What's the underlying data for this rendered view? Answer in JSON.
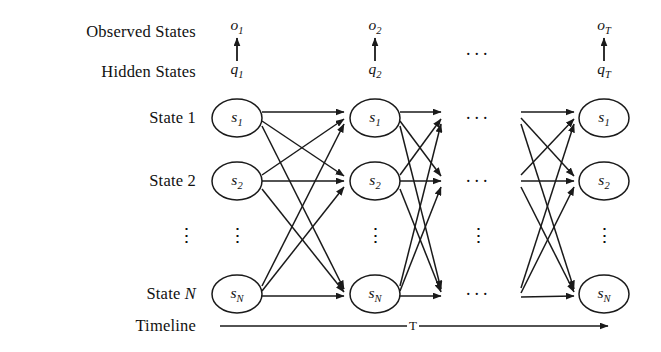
{
  "diagram": {
    "stroke_color": "#1a1a1a",
    "background_color": "#ffffff",
    "row_labels": [
      {
        "key": "observed",
        "text": "Observed States",
        "y": 32
      },
      {
        "key": "hidden",
        "text": "Hidden States",
        "y": 72
      },
      {
        "key": "state1",
        "text": "State 1",
        "y": 118
      },
      {
        "key": "state2",
        "text": "State 2",
        "y": 181
      },
      {
        "key": "stateN",
        "text": "State N",
        "y": 294
      },
      {
        "key": "timeline",
        "text": "Timeline",
        "y": 326
      }
    ],
    "row_vdots": {
      "text": "⋮",
      "y": 235
    },
    "observed_nodes": [
      {
        "label": "o",
        "sub": "1",
        "x": 237
      },
      {
        "label": "o",
        "sub": "2",
        "x": 375
      },
      {
        "label": "o",
        "sub": "T",
        "x": 604
      }
    ],
    "hidden_nodes": [
      {
        "label": "q",
        "sub": "1",
        "x": 237
      },
      {
        "label": "q",
        "sub": "2",
        "x": 375
      },
      {
        "label": "q",
        "sub": "T",
        "x": 604
      }
    ],
    "observed_y": 26,
    "hidden_y": 70,
    "columns": [
      {
        "key": "t1",
        "x": 237
      },
      {
        "key": "t2",
        "x": 375
      },
      {
        "key": "tT",
        "x": 604
      }
    ],
    "state_rows": [
      {
        "key": "s1",
        "label": "s",
        "sub": "1",
        "y": 118
      },
      {
        "key": "s2",
        "label": "s",
        "sub": "2",
        "y": 181
      },
      {
        "key": "sN",
        "label": "s",
        "sub": "N",
        "y": 294
      }
    ],
    "column_vdots": {
      "text": "⋮",
      "y": 235
    },
    "ellipsis": {
      "text": "···",
      "x": 478,
      "rows_y": [
        54,
        118,
        181,
        294
      ],
      "vdots_y": 235
    },
    "timeline": {
      "label": "T",
      "label_x": 413,
      "y": 326,
      "x_start": 220,
      "x_end": 608
    },
    "node_rx": 25,
    "node_ry": 19
  }
}
